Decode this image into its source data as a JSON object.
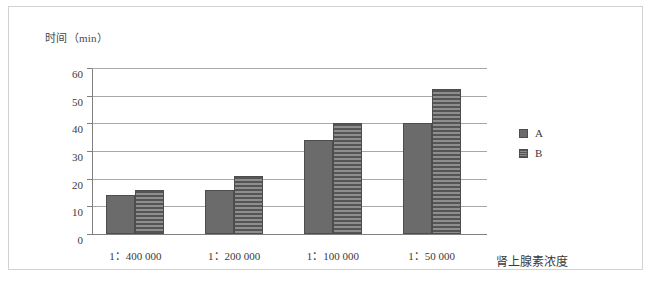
{
  "chart_data": {
    "type": "bar",
    "title": "",
    "ylabel": "时间（min）",
    "xlabel": "肾上腺素浓度",
    "categories": [
      "1：400 000",
      "1：200 000",
      "1：100 000",
      "1：50 000"
    ],
    "series": [
      {
        "name": "A",
        "values": [
          14,
          16,
          34,
          40
        ]
      },
      {
        "name": "B",
        "values": [
          16,
          21,
          40,
          52.5
        ]
      }
    ],
    "ylim": [
      0,
      60
    ],
    "yticks": [
      0,
      10,
      20,
      30,
      40,
      50,
      60
    ],
    "ytick_labels": [
      "0",
      "10",
      "20",
      "30",
      "40",
      "50",
      "60"
    ],
    "grid": true,
    "legend_position": "right",
    "colors": {
      "series_a": "#6b6b6b",
      "series_b": "#555555",
      "gridline": "#a8a8a8",
      "axis": "#808080",
      "frame": "#d2d2d2",
      "background": "#ffffff"
    }
  },
  "legend": {
    "entries": [
      {
        "label": "A"
      },
      {
        "label": "B"
      }
    ]
  }
}
